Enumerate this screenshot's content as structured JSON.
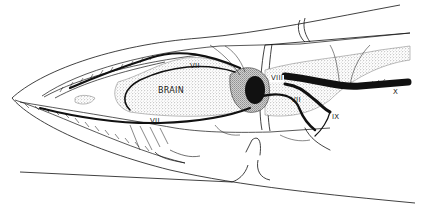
{
  "figure": {
    "labels": {
      "brain": "BRAIN",
      "vii_upper": "VII",
      "vii_lower": "VII",
      "vii_posterior": "VII",
      "viii": "VIII",
      "ix": "IX",
      "x": "X"
    },
    "colors": {
      "ink": "#111111",
      "stipple": "#bdbdbd",
      "background": "#ffffff"
    }
  }
}
